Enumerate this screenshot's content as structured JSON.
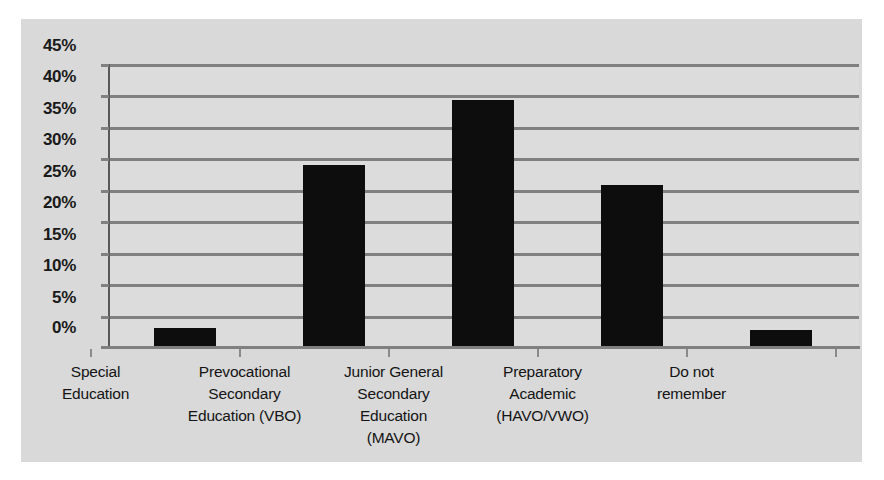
{
  "chart_data": {
    "type": "bar",
    "title": "",
    "subtitle": "",
    "xlabel": "",
    "ylabel": "",
    "grid": true,
    "legend": false,
    "ylim": [
      0,
      45
    ],
    "ytick_step": 5,
    "ytick_labels": [
      "45%",
      "40%",
      "35%",
      "30%",
      "25%",
      "20%",
      "15%",
      "10%",
      "5%",
      "0%"
    ],
    "ytick_values": [
      45,
      40,
      35,
      30,
      25,
      20,
      15,
      10,
      5,
      0
    ],
    "categories": [
      "Special Education",
      "Prevocational Secondary Education (VBO)",
      "Junior General Secondary Education (MAVO)",
      "Preparatory Academic (HAVO/VWO)",
      "Do not remember"
    ],
    "category_lines": [
      [
        "Special",
        "Education"
      ],
      [
        "Prevocational",
        "Secondary",
        "Education (VBO)"
      ],
      [
        "Junior General",
        "Secondary",
        "Education",
        "(MAVO)"
      ],
      [
        "Preparatory",
        "Academic",
        "(HAVO/VWO)"
      ],
      [
        "Do not",
        "remember"
      ]
    ],
    "values": [
      3.0,
      29.0,
      39.2,
      25.7,
      2.7
    ],
    "value_labels": [
      "3%",
      "29%",
      "39%",
      "26%",
      "3%"
    ],
    "series_name": "",
    "colors": {
      "bar": "#0d0d0d",
      "panel_background": "#d9d9d9",
      "plot_background": "#dcdcdc",
      "gridline": "#808080",
      "axis": "#595959",
      "tick_label": "#1a1a1a",
      "category_label": "#141414",
      "page_background": "#ffffff"
    }
  }
}
